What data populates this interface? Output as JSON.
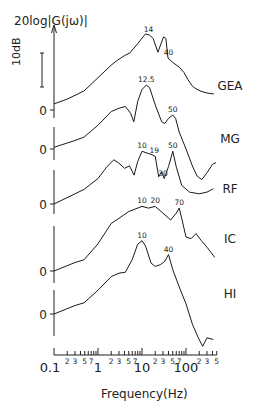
{
  "chart_data": {
    "type": "line",
    "title": "",
    "ylabel": "20log|G(jω)|",
    "xlabel": "Frequency(Hz)",
    "xscale": "log",
    "xlim": [
      0.1,
      500
    ],
    "scale_bar": "10dB",
    "x_ticks_major": [
      "0.1",
      "1",
      "10",
      "100"
    ],
    "x_ticks_minor_labels": [
      "2",
      "3",
      "5",
      "7"
    ],
    "x_ticks_minor_labels_last_decade": [
      "2",
      "3",
      "5"
    ],
    "zero_label": "0",
    "series": [
      {
        "name": "GEA",
        "peak_labels": [
          {
            "f": 14,
            "text": "14"
          },
          {
            "f": 40,
            "text": "40"
          }
        ],
        "points": [
          [
            0.1,
            1.8
          ],
          [
            0.2,
            3.2
          ],
          [
            0.48,
            5.6
          ],
          [
            1.0,
            9.5
          ],
          [
            2.0,
            13.2
          ],
          [
            2.8,
            14.7
          ],
          [
            4.0,
            16
          ],
          [
            5.3,
            16.8
          ],
          [
            8,
            19.5
          ],
          [
            11,
            21.8
          ],
          [
            12,
            22.4
          ],
          [
            15,
            22
          ],
          [
            18,
            21
          ],
          [
            23,
            17
          ],
          [
            27,
            19.5
          ],
          [
            31,
            21.5
          ],
          [
            35,
            21
          ],
          [
            39,
            15.3
          ],
          [
            50,
            14
          ],
          [
            73,
            12.4
          ],
          [
            90,
            11
          ],
          [
            110,
            9
          ],
          [
            140,
            7
          ],
          [
            170,
            6.2
          ],
          [
            220,
            5.5
          ],
          [
            300,
            5.0
          ],
          [
            430,
            4.7
          ]
        ]
      },
      {
        "name": "MG",
        "peak_labels": [
          {
            "f": 12.5,
            "text": "12.5"
          },
          {
            "f": 50,
            "text": "50"
          }
        ],
        "points": [
          [
            0.1,
            0.5
          ],
          [
            0.3,
            2.5
          ],
          [
            0.48,
            3.5
          ],
          [
            1.0,
            7
          ],
          [
            2.0,
            11
          ],
          [
            3.0,
            12
          ],
          [
            4.2,
            12.5
          ],
          [
            5.5,
            10.5
          ],
          [
            6.5,
            8
          ],
          [
            8,
            14
          ],
          [
            10,
            17.5
          ],
          [
            12.5,
            18.8
          ],
          [
            15,
            18
          ],
          [
            20,
            13
          ],
          [
            28,
            8
          ],
          [
            33,
            7.5
          ],
          [
            40,
            9
          ],
          [
            50,
            10
          ],
          [
            58,
            9
          ],
          [
            70,
            5
          ],
          [
            100,
            0
          ],
          [
            140,
            -5
          ],
          [
            180,
            -8
          ],
          [
            230,
            -9
          ],
          [
            300,
            -7
          ],
          [
            400,
            -4.5
          ],
          [
            480,
            -4
          ]
        ]
      },
      {
        "name": "RF",
        "peak_labels": [
          {
            "f": 10,
            "text": "10"
          },
          {
            "f": 19,
            "text": "19"
          },
          {
            "f": 30,
            "text": "30"
          },
          {
            "f": 50,
            "text": "50"
          }
        ],
        "points": [
          [
            0.1,
            0
          ],
          [
            0.3,
            3
          ],
          [
            0.48,
            4.3
          ],
          [
            1.0,
            7.5
          ],
          [
            1.6,
            11
          ],
          [
            2.3,
            13
          ],
          [
            3.0,
            12
          ],
          [
            4.0,
            10.5
          ],
          [
            5.2,
            11.2
          ],
          [
            6.6,
            8.5
          ],
          [
            8,
            12.5
          ],
          [
            10,
            15.5
          ],
          [
            13,
            15
          ],
          [
            17,
            14.5
          ],
          [
            20,
            14
          ],
          [
            24,
            8
          ],
          [
            28,
            9.5
          ],
          [
            32,
            7.5
          ],
          [
            40,
            11
          ],
          [
            50,
            15.5
          ],
          [
            60,
            11
          ],
          [
            80,
            5.5
          ],
          [
            120,
            3.5
          ],
          [
            200,
            3
          ],
          [
            300,
            3.5
          ],
          [
            420,
            4.5
          ]
        ]
      },
      {
        "name": "IC",
        "peak_labels": [
          {
            "f": 10,
            "text": "10"
          },
          {
            "f": 20,
            "text": "20"
          },
          {
            "f": 70,
            "text": "70"
          }
        ],
        "points": [
          [
            0.1,
            0
          ],
          [
            0.3,
            2.5
          ],
          [
            0.48,
            3.3
          ],
          [
            1.0,
            8
          ],
          [
            2.0,
            14
          ],
          [
            3.0,
            15.5
          ],
          [
            5.0,
            17.5
          ],
          [
            10,
            19
          ],
          [
            14,
            18.5
          ],
          [
            20,
            19
          ],
          [
            30,
            17
          ],
          [
            45,
            15
          ],
          [
            60,
            17
          ],
          [
            70,
            18.5
          ],
          [
            80,
            15.5
          ],
          [
            100,
            10
          ],
          [
            130,
            9.5
          ],
          [
            170,
            11
          ],
          [
            220,
            9
          ],
          [
            300,
            7
          ],
          [
            450,
            4
          ]
        ]
      },
      {
        "name": "HI",
        "peak_labels": [
          {
            "f": 10,
            "text": "10"
          },
          {
            "f": 40,
            "text": "40"
          }
        ],
        "points": [
          [
            0.1,
            0
          ],
          [
            0.3,
            2.5
          ],
          [
            0.48,
            3.3
          ],
          [
            1.0,
            7
          ],
          [
            2.0,
            11
          ],
          [
            3.0,
            12
          ],
          [
            4.2,
            12.3
          ],
          [
            6.0,
            16
          ],
          [
            8,
            20.5
          ],
          [
            10,
            21.6
          ],
          [
            12,
            20
          ],
          [
            16,
            15
          ],
          [
            20,
            14
          ],
          [
            26,
            14.5
          ],
          [
            33,
            15.5
          ],
          [
            40,
            17.5
          ],
          [
            50,
            13
          ],
          [
            70,
            8
          ],
          [
            100,
            3
          ],
          [
            140,
            -3
          ],
          [
            190,
            -7
          ],
          [
            240,
            -9.5
          ],
          [
            300,
            -7
          ],
          [
            420,
            -7.5
          ]
        ]
      }
    ]
  },
  "layout": {
    "zero_y": [
      110,
      149,
      204,
      271,
      314
    ],
    "label_y": [
      85,
      138,
      188,
      238,
      293
    ],
    "px_per_db": 3.4,
    "x0": 54,
    "px_per_decade": 44,
    "axis_y": 355
  }
}
